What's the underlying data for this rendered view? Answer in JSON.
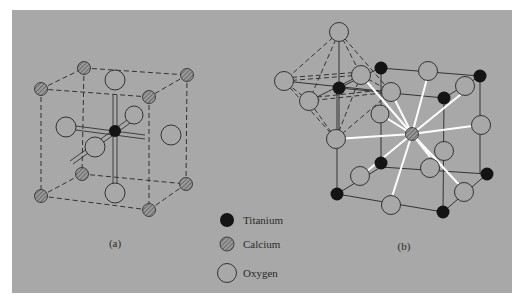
{
  "figure": {
    "panel_a_label": "(a)",
    "panel_b_label": "(b)",
    "panel_a_description": "Perovskite unit cell centered on titanium, with oxygen atoms at face centers bonded to the central titanium and calcium atoms at the cube corners",
    "panel_b_description": "Perovskite unit cell centered on calcium, with titanium atoms at the cube corners, oxygen atoms at edge midpoints, and a TiO6 octahedron drawn at the upper-left corner"
  },
  "legend": {
    "items": [
      {
        "label": "Titanium",
        "symbol": "filled-black-circle"
      },
      {
        "label": "Calcium",
        "symbol": "hatched-circle"
      },
      {
        "label": "Oxygen",
        "symbol": "open-circle"
      }
    ]
  },
  "colors": {
    "background": "#a8a8a8",
    "titanium": "#1a1a1a",
    "calcium": "#8e8e8e",
    "oxygen": "#a8a8a8",
    "outline": "#3a3a3a",
    "ca_o_bond": "#ffffff"
  }
}
